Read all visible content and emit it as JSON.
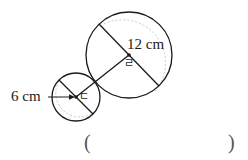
{
  "page": {
    "background_color": "#ffffff",
    "ink_color": "#1a1a1a",
    "guide_color": "#bbbbbb"
  },
  "figure": {
    "name": "two-circles-geometry-figure",
    "large_circle": {
      "center_label": "ㄹ",
      "measure_label": "12 cm",
      "measure_kind": "diameter",
      "cx": 129,
      "cy": 55,
      "r": 43
    },
    "small_circle": {
      "center_label": "ㄷ",
      "measure_label": "6 cm",
      "measure_kind": "radius",
      "cx": 76,
      "cy": 97,
      "r": 24
    }
  },
  "answer_blank": {
    "open_paren": "(",
    "close_paren": ")"
  }
}
